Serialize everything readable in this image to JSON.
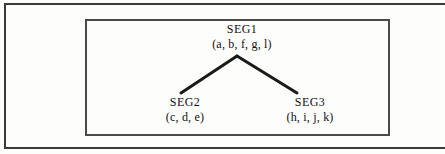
{
  "figure": {
    "type": "tree-diagram",
    "title": "",
    "caption": "",
    "frame": {
      "outer_border_color": "#3a3a3a",
      "inner_border_color": "#4a4a4a",
      "background_color": "#fdfdfc"
    },
    "edge_color": "#1a1a1a",
    "nodes": [
      {
        "id": "root",
        "name": "SEG1",
        "members": "(a, b, f, g, l)"
      },
      {
        "id": "left-child",
        "name": "SEG2",
        "members": "(c, d, e)"
      },
      {
        "id": "right-child",
        "name": "SEG3",
        "members": "(h, i, j, k)"
      }
    ],
    "edges": [
      {
        "from": "SEG1",
        "to": "SEG2"
      },
      {
        "from": "SEG1",
        "to": "SEG3"
      }
    ]
  }
}
